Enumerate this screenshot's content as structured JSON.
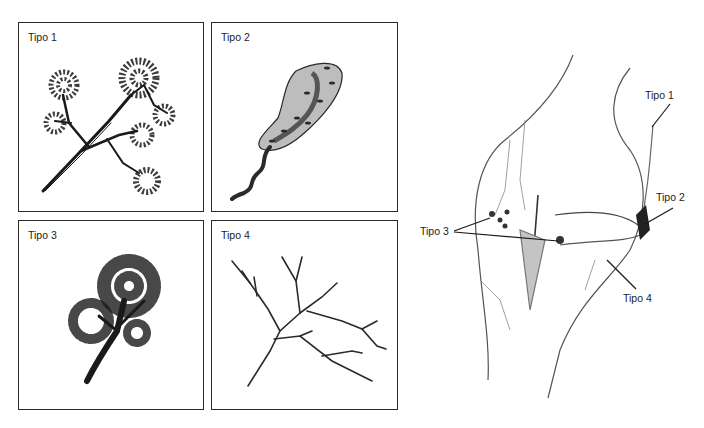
{
  "figure": {
    "panels": [
      {
        "id": "tipo1",
        "label": "Tipo 1",
        "description": "branched nerve ending with bushy terminal clusters"
      },
      {
        "id": "tipo2",
        "label": "Tipo 2",
        "description": "encapsulated elongated corpuscle"
      },
      {
        "id": "tipo3",
        "label": "Tipo 3",
        "description": "dense arborized tree-like ending"
      },
      {
        "id": "tipo4",
        "label": "Tipo 4",
        "description": "free branching nerve endings"
      }
    ],
    "knee_diagram": {
      "callouts": [
        {
          "id": "tipo1",
          "label": "Tipo 1"
        },
        {
          "id": "tipo2",
          "label": "Tipo 2"
        },
        {
          "id": "tipo3",
          "label": "Tipo 3"
        },
        {
          "id": "tipo4",
          "label": "Tipo 4"
        }
      ]
    },
    "colors": {
      "ink": "#1a1a1a",
      "border": "#2a2a2a",
      "shade": "#8a8a8a",
      "background": "#ffffff"
    }
  }
}
